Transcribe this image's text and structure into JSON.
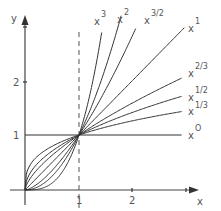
{
  "chart_data": {
    "type": "line",
    "title": "",
    "xlabel": "x",
    "ylabel": "y",
    "x_ticks": [
      "1",
      "2"
    ],
    "y_ticks": [
      "1",
      "2"
    ],
    "xlim": [
      0,
      3.1
    ],
    "ylim": [
      0,
      3.0
    ],
    "grid": false,
    "legend_position": "inline-right",
    "annotations": [
      "dashed vertical line at x = 1",
      "all curves pass through (0,0) and (1,1)"
    ],
    "series": [
      {
        "name": "x^3",
        "base": "x",
        "exponent": "3",
        "power": 3
      },
      {
        "name": "x^2",
        "base": "x",
        "exponent": "2",
        "power": 2
      },
      {
        "name": "x^3/2",
        "base": "x",
        "exponent": "3/2",
        "power": 1.5
      },
      {
        "name": "x^1",
        "base": "x",
        "exponent": "1",
        "power": 1
      },
      {
        "name": "x^2/3",
        "base": "x",
        "exponent": "2/3",
        "power": 0.6667
      },
      {
        "name": "x^1/2",
        "base": "x",
        "exponent": "1/2",
        "power": 0.5
      },
      {
        "name": "x^1/3",
        "base": "x",
        "exponent": "1/3",
        "power": 0.3333
      },
      {
        "name": "x^0",
        "base": "x",
        "exponent": "0",
        "power": 0
      }
    ]
  },
  "axes": {
    "x_label": "x",
    "y_label": "y",
    "x_tick_1": "1",
    "x_tick_2": "2",
    "y_tick_1": "1",
    "y_tick_2": "2"
  },
  "labels": {
    "x3": {
      "base": "x",
      "exp": "3"
    },
    "x2": {
      "base": "x",
      "exp": "2"
    },
    "x32": {
      "base": "x",
      "exp": "3/2"
    },
    "x1": {
      "base": "x",
      "exp": "1"
    },
    "x23": {
      "base": "x",
      "exp": "2/3"
    },
    "x12": {
      "base": "x",
      "exp": "1/2"
    },
    "x13": {
      "base": "x",
      "exp": "1/3"
    },
    "x0": {
      "base": "x",
      "exp": "O"
    }
  },
  "colors": {
    "curve": "#333333",
    "axis": "#444444",
    "text": "#555555"
  }
}
